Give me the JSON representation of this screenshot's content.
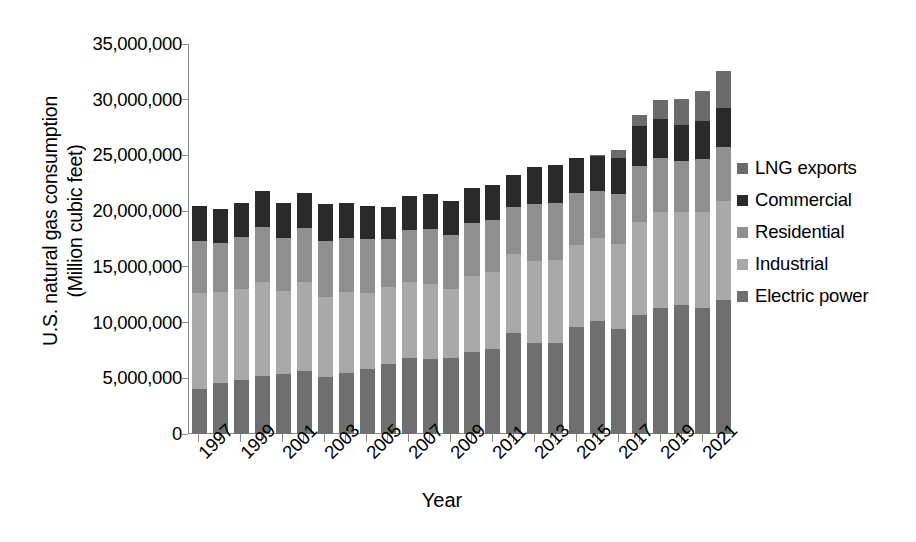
{
  "chart_data": {
    "type": "bar",
    "subtype": "stacked",
    "title": "",
    "xlabel": "Year",
    "ylabel": "U.S. natural gas consumption (Million cubic feet)",
    "ylabel_line1": "U.S. natural gas consumption",
    "ylabel_line2": "(Million cubic feet)",
    "ylim": [
      0,
      35000000
    ],
    "ytick_values": [
      0,
      5000000,
      10000000,
      15000000,
      20000000,
      25000000,
      30000000,
      35000000
    ],
    "ytick_labels": [
      "0",
      "5,000,000",
      "10,000,000",
      "15,000,000",
      "20,000,000",
      "25,000,000",
      "30,000,000",
      "35,000,000"
    ],
    "grid": false,
    "legend_position": "right",
    "categories": [
      1997,
      1998,
      1999,
      2000,
      2001,
      2002,
      2003,
      2004,
      2005,
      2006,
      2007,
      2008,
      2009,
      2010,
      2011,
      2012,
      2013,
      2014,
      2015,
      2016,
      2017,
      2018,
      2019,
      2020,
      2021,
      2022
    ],
    "xtick_labels": [
      "1997",
      "1999",
      "2001",
      "2003",
      "2005",
      "2007",
      "2009",
      "2011",
      "2013",
      "2015",
      "2017",
      "2019",
      "2021"
    ],
    "xtick_label_years": [
      1997,
      1999,
      2001,
      2003,
      2005,
      2007,
      2009,
      2011,
      2013,
      2015,
      2017,
      2019,
      2021
    ],
    "stack_order_bottom_to_top": [
      "Electric power",
      "Industrial",
      "Residential",
      "Commercial",
      "LNG exports"
    ],
    "series": [
      {
        "name": "Electric power",
        "color": "#6f6f6f",
        "values": [
          4050000,
          4550000,
          4850000,
          5200000,
          5350000,
          5700000,
          5150000,
          5450000,
          5850000,
          6250000,
          6800000,
          6700000,
          6850000,
          7400000,
          7600000,
          9100000,
          8200000,
          8200000,
          9600000,
          10100000,
          9400000,
          10700000,
          11300000,
          11600000,
          11300000,
          12000000
        ]
      },
      {
        "name": "Industrial",
        "color": "#a9a9a9",
        "values": [
          8650000,
          8200000,
          8150000,
          8400000,
          7500000,
          7900000,
          7150000,
          7300000,
          6850000,
          6900000,
          6850000,
          6800000,
          6200000,
          6750000,
          6900000,
          7100000,
          7300000,
          7400000,
          7400000,
          7450000,
          7650000,
          8300000,
          8600000,
          8300000,
          8600000,
          8900000
        ]
      },
      {
        "name": "Residential",
        "color": "#8f8f8f",
        "values": [
          4650000,
          4350000,
          4650000,
          4950000,
          4750000,
          4850000,
          5050000,
          4850000,
          4800000,
          4350000,
          4700000,
          4900000,
          4800000,
          4800000,
          4700000,
          4150000,
          5100000,
          5100000,
          4600000,
          4300000,
          4500000,
          5050000,
          4900000,
          4600000,
          4800000,
          4900000
        ]
      },
      {
        "name": "Commercial",
        "color": "#2a2a2a",
        "values": [
          3150000,
          3050000,
          3050000,
          3250000,
          3150000,
          3150000,
          3250000,
          3150000,
          3000000,
          2850000,
          3000000,
          3150000,
          3100000,
          3100000,
          3150000,
          2900000,
          3350000,
          3400000,
          3200000,
          3100000,
          3200000,
          3550000,
          3500000,
          3250000,
          3400000,
          3500000
        ]
      },
      {
        "name": "LNG exports",
        "color": "#6b6b6b",
        "values": [
          0,
          0,
          0,
          0,
          0,
          0,
          0,
          0,
          0,
          0,
          0,
          0,
          0,
          0,
          0,
          0,
          0,
          0,
          0,
          100000,
          700000,
          1000000,
          1700000,
          2300000,
          2700000,
          3300000
        ]
      }
    ],
    "totals": [
      20500000,
      20150000,
      20700000,
      21800000,
      20750000,
      21600000,
      20600000,
      20750000,
      20500000,
      20350000,
      21350000,
      21550000,
      20950000,
      22050000,
      22350000,
      23250000,
      23950000,
      24100000,
      24800000,
      25050000,
      25450000,
      28600000,
      30000000,
      30050000,
      30800000,
      32600000
    ]
  },
  "legend": {
    "items": [
      {
        "label": "LNG exports",
        "color": "#6b6b6b"
      },
      {
        "label": "Commercial",
        "color": "#2a2a2a"
      },
      {
        "label": "Residential",
        "color": "#8f8f8f"
      },
      {
        "label": "Industrial",
        "color": "#a9a9a9"
      },
      {
        "label": "Electric power",
        "color": "#6f6f6f"
      }
    ]
  },
  "axes": {
    "x_title": "Year",
    "y_title_line1": "U.S. natural gas consumption",
    "y_title_line2": "(Million cubic feet)"
  }
}
